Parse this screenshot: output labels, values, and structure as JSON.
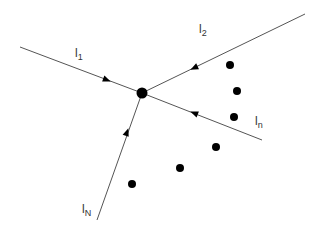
{
  "diagram": {
    "title": "",
    "center_node": {
      "x": 142,
      "y": 93,
      "r": 5
    },
    "lines": [
      {
        "id": "l1",
        "label": "l",
        "subscript": "1",
        "from": [
          20,
          47
        ],
        "to": [
          142,
          93
        ],
        "arrow_at": [
          107,
          80
        ],
        "direction": "toward-center",
        "label_pos": [
          75,
          57
        ]
      },
      {
        "id": "l2",
        "label": "l",
        "subscript": "2",
        "from": [
          305,
          14
        ],
        "to": [
          142,
          93
        ],
        "arrow_at": [
          194,
          68
        ],
        "direction": "toward-center",
        "label_pos": [
          199,
          33
        ]
      },
      {
        "id": "ln",
        "label": "l",
        "subscript": "n",
        "from": [
          262,
          140
        ],
        "to": [
          142,
          93
        ],
        "arrow_at": [
          194,
          113
        ],
        "direction": "toward-center",
        "label_pos": [
          255,
          125
        ]
      },
      {
        "id": "lN",
        "label": "l",
        "subscript": "N",
        "from": [
          97,
          220
        ],
        "to": [
          142,
          93
        ],
        "arrow_at": [
          127,
          132
        ],
        "direction": "toward-center",
        "label_pos": [
          82,
          213
        ]
      }
    ],
    "ellipsis_dots": [
      {
        "x": 230,
        "y": 65
      },
      {
        "x": 237,
        "y": 91
      },
      {
        "x": 234,
        "y": 117
      },
      {
        "x": 216,
        "y": 147
      },
      {
        "x": 180,
        "y": 168
      },
      {
        "x": 132,
        "y": 184
      }
    ],
    "colors": {
      "line": "#555555",
      "node": "#000000",
      "text": "#333333"
    }
  }
}
